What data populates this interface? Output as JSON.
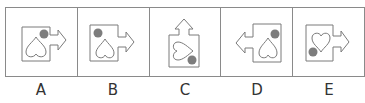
{
  "options": [
    {
      "label": "A",
      "arrow": "right",
      "heart": "inverted",
      "dot": "top-right",
      "icon": "box-arrow-heart-dot-icon"
    },
    {
      "label": "B",
      "arrow": "right",
      "heart": "inverted",
      "dot": "top-left",
      "icon": "box-arrow-heart-dot-icon"
    },
    {
      "label": "C",
      "arrow": "up",
      "heart": "rotated-left",
      "dot": "bottom-right",
      "icon": "box-arrow-heart-dot-icon"
    },
    {
      "label": "D",
      "arrow": "left",
      "heart": "inverted",
      "dot": "top-right",
      "icon": "box-arrow-heart-dot-icon"
    },
    {
      "label": "E",
      "arrow": "right",
      "heart": "upright",
      "dot": "bottom-left",
      "icon": "box-arrow-heart-dot-icon"
    }
  ],
  "colors": {
    "stroke": "#7a7a7a",
    "dot": "#7d7d7d",
    "border": "#8a8a8a"
  }
}
